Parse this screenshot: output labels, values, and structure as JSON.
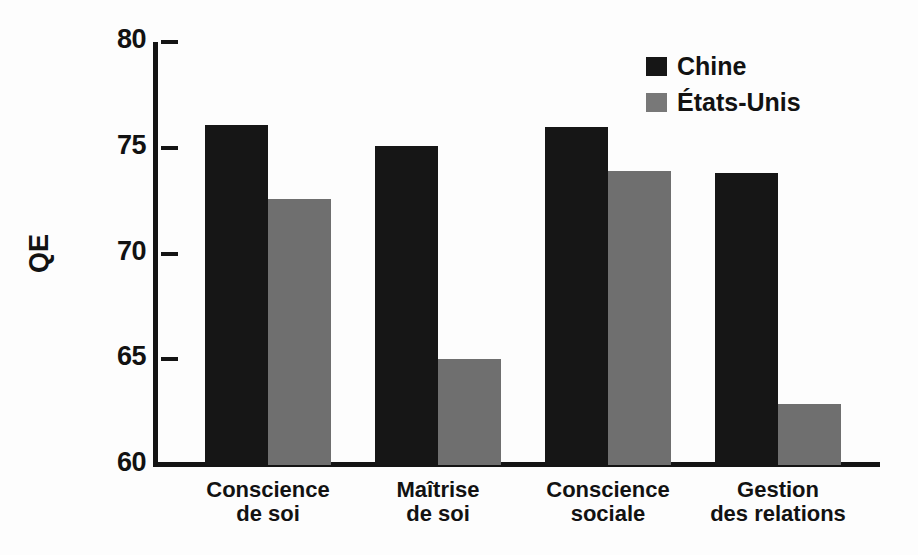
{
  "chart_data": {
    "type": "bar",
    "title": "",
    "subtitle": "",
    "xlabel": "",
    "ylabel": "QE",
    "ylim": [
      60,
      80
    ],
    "yticks": [
      60,
      65,
      70,
      75,
      80
    ],
    "ytick_labels": [
      "60",
      "65",
      "70",
      "75",
      "80"
    ],
    "grid": false,
    "legend_position": "top-right",
    "categories": [
      "Conscience\nde soi",
      "Maîtrise\nde soi",
      "Conscience\nsociale",
      "Gestion\ndes relations"
    ],
    "series": [
      {
        "name": "Chine",
        "color": "#161616",
        "values": [
          76.1,
          75.1,
          76.0,
          73.8
        ]
      },
      {
        "name": "États-Unis",
        "color": "#6f6f6f",
        "values": [
          72.6,
          65.0,
          73.9,
          62.9
        ]
      }
    ]
  },
  "legend": {
    "items": [
      {
        "label": "Chine",
        "color": "#161616"
      },
      {
        "label": "États-Unis",
        "color": "#787878"
      }
    ]
  },
  "colors": {
    "background": "#fdfdfd",
    "axis": "#141414",
    "text": "#121212",
    "series_0": "#161616",
    "series_1": "#6f6f6f"
  }
}
